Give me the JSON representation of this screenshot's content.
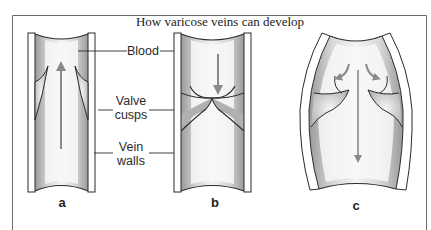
{
  "figure": {
    "title": "How varicose veins can develop",
    "labels": {
      "blood": "Blood",
      "valve_line1": "Valve",
      "valve_line2": "cusps",
      "walls_line1": "Vein",
      "walls_line2": "walls"
    },
    "panels": [
      {
        "id": "a",
        "label": "a",
        "description": "Healthy vein: valve cusps open, blood flows upward"
      },
      {
        "id": "b",
        "label": "b",
        "description": "Valve cusps close to stop backflow"
      },
      {
        "id": "c",
        "label": "c",
        "description": "Dilated vein: cusps cannot meet, blood flows back down"
      }
    ],
    "colors": {
      "ink": "#2a2a2a",
      "arrow": "#8a8a8a",
      "shading": "#c8c8c8",
      "background": "#ffffff",
      "frame": "#6a6a6a"
    }
  }
}
